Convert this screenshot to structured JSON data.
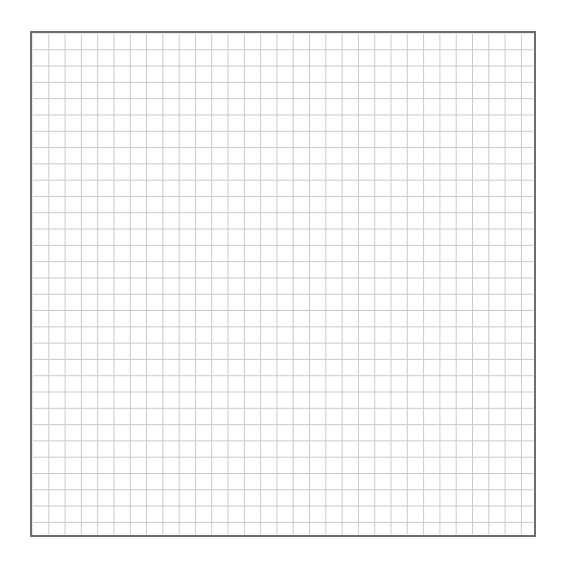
{
  "page": {
    "background_color": "#ffffff",
    "width": 566,
    "height": 562,
    "title": "",
    "caption": ""
  },
  "grid_panel": {
    "label": "",
    "border_color": "#6e6e6e",
    "border_width_px": 2,
    "fill_color": "#ffffff",
    "left_px": 30,
    "top_px": 31,
    "width_px": 506,
    "height_px": 506
  },
  "gridlines": {
    "color": "#c9c9c9",
    "line_width_px": 1,
    "cell_size_px": 16.3,
    "columns": 31,
    "rows": 31,
    "major_gridlines": "none",
    "axis_labels": "none",
    "tick_labels": "none"
  },
  "chart_data": {
    "type": "table",
    "title": "",
    "subtitle": "",
    "xlabel": "",
    "ylabel": "",
    "categories": [],
    "values": [],
    "series": [],
    "annotations": [],
    "legend": [],
    "legend_position": "none",
    "grid": true,
    "xlim": [
      0,
      31
    ],
    "ylim": [
      0,
      31
    ],
    "xticks": [],
    "yticks": []
  }
}
